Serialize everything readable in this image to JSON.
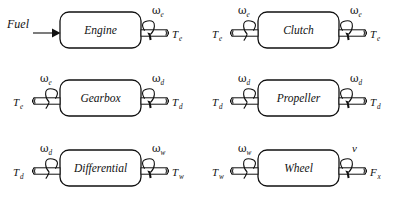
{
  "figure": {
    "type": "block-diagram",
    "background_color": "#ffffff",
    "line_color": "#111111",
    "columns": 2,
    "rows": 3
  },
  "symbols": {
    "omega": "ω",
    "arrow_head": "solid-triangle",
    "rotation_arc": "curved-arrow"
  },
  "blocks": [
    {
      "id": "engine",
      "label": "Engine",
      "row": 0,
      "col": 0,
      "input": {
        "kind": "signal",
        "label": "Fuel",
        "speed": null,
        "speed_sub": null,
        "torque": null,
        "torque_sub": null
      },
      "output": {
        "kind": "shaft",
        "speed": "ω",
        "speed_sub": "e",
        "torque": "T",
        "torque_sub": "e"
      }
    },
    {
      "id": "clutch",
      "label": "Clutch",
      "row": 0,
      "col": 1,
      "input": {
        "kind": "shaft",
        "speed": "ω",
        "speed_sub": "e",
        "torque": "T",
        "torque_sub": "e"
      },
      "output": {
        "kind": "shaft",
        "speed": "ω",
        "speed_sub": "e",
        "torque": "T",
        "torque_sub": "e"
      }
    },
    {
      "id": "gearbox",
      "label": "Gearbox",
      "row": 1,
      "col": 0,
      "input": {
        "kind": "shaft",
        "speed": "ω",
        "speed_sub": "e",
        "torque": "T",
        "torque_sub": "e"
      },
      "output": {
        "kind": "shaft",
        "speed": "ω",
        "speed_sub": "d",
        "torque": "T",
        "torque_sub": "d"
      }
    },
    {
      "id": "propeller",
      "label": "Propeller",
      "row": 1,
      "col": 1,
      "input": {
        "kind": "shaft",
        "speed": "ω",
        "speed_sub": "d",
        "torque": "T",
        "torque_sub": "d"
      },
      "output": {
        "kind": "shaft",
        "speed": "ω",
        "speed_sub": "d",
        "torque": "T",
        "torque_sub": "d"
      }
    },
    {
      "id": "differential",
      "label": "Differential",
      "row": 2,
      "col": 0,
      "input": {
        "kind": "shaft",
        "speed": "ω",
        "speed_sub": "d",
        "torque": "T",
        "torque_sub": "d"
      },
      "output": {
        "kind": "shaft",
        "speed": "ω",
        "speed_sub": "w",
        "torque": "T",
        "torque_sub": "w"
      }
    },
    {
      "id": "wheel",
      "label": "Wheel",
      "row": 2,
      "col": 1,
      "input": {
        "kind": "shaft",
        "speed": "ω",
        "speed_sub": "w",
        "torque": "T",
        "torque_sub": "w"
      },
      "output": {
        "kind": "shaft",
        "speed": "v",
        "speed_sub": "",
        "torque": "F",
        "torque_sub": "x"
      }
    }
  ]
}
